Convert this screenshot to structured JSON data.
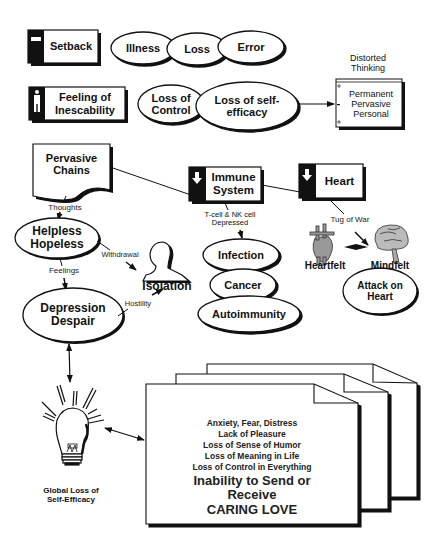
{
  "diagram": {
    "title_fragment": "",
    "row1": {
      "badge": {
        "label": "Setback",
        "icon": "minus-icon"
      },
      "ellipses": [
        "Illness",
        "Loss",
        "Error"
      ]
    },
    "row2": {
      "badge": {
        "label": "Feeling of\nInescability",
        "icon": "person-figure-icon"
      },
      "ellipses": [
        "Loss of\nControl",
        "Loss of self-\nefficacy"
      ],
      "distorted_thinking": {
        "caption": "Distorted\nThinking",
        "items": "Permanent\nPervasive\nPersonal"
      }
    },
    "chains": {
      "label": "Pervasive\nChains",
      "thoughts_label": "Thoughts",
      "helpless": "Helpless\nHopeless",
      "withdrawal_label": "Withdrawal",
      "feelings_label": "Feelings",
      "isolation": "Isolation",
      "hostility_label": "Hostility",
      "depression": "Depression\nDespair"
    },
    "immune": {
      "badge": {
        "label": "Immune\nSystem",
        "icon": "down-arrow-icon"
      },
      "note": "T-cell  & NK cell\nDepressed",
      "ellipses": [
        "Infection",
        "Cancer",
        "Autoimmunity"
      ]
    },
    "heart": {
      "badge": {
        "label": "Heart",
        "icon": "down-arrow-icon"
      },
      "tug_label": "Tug of War",
      "heartfelt": "Heartfelt",
      "mindfelt": "Mindfelt",
      "attack": "Attack on\nHeart"
    },
    "bulb": {
      "caption": "Global Loss of\nSelf-Efficacy"
    },
    "pages": {
      "items": [
        "Anxiety, Fear, Distress",
        "Lack of Pleasure",
        "Loss of Sense of Humor",
        "Loss of Meaning in Life",
        "Loss of Control in Everything"
      ],
      "emphasis_1": "Inability to Send or\nReceive",
      "emphasis_2": "CARING LOVE"
    }
  }
}
